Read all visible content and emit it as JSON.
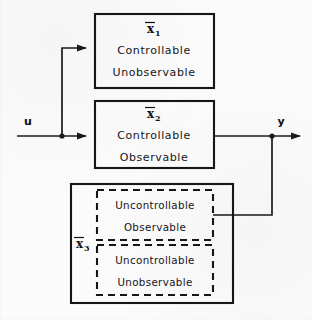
{
  "figure": {
    "type": "block-diagram",
    "background_color": "#fbfbfb",
    "line_color": "#16161a"
  },
  "signals": {
    "input_label": "u",
    "output_label": "y"
  },
  "blocks": [
    {
      "id": "x1",
      "state_label": "x",
      "state_subscript": "1",
      "overbar": true,
      "border": "solid",
      "lines": [
        "Controllable",
        "Unobservable"
      ]
    },
    {
      "id": "x2",
      "state_label": "x",
      "state_subscript": "2",
      "overbar": true,
      "border": "solid",
      "lines": [
        "Controllable",
        "Observable"
      ]
    },
    {
      "id": "x3",
      "state_label": "x",
      "state_subscript": "3",
      "overbar": true,
      "border": "solid",
      "lines": [],
      "sub_blocks": [
        {
          "id": "x3a",
          "border": "dashed",
          "lines": [
            "Uncontrollable",
            "Observable"
          ]
        },
        {
          "id": "x3b",
          "border": "dashed",
          "lines": [
            "Uncontrollable",
            "Unobservable"
          ]
        }
      ]
    }
  ],
  "connections": [
    {
      "from": "u",
      "to": "x1",
      "style": "branch-up"
    },
    {
      "from": "u",
      "to": "x2",
      "style": "straight"
    },
    {
      "from": "x2",
      "to": "y",
      "style": "straight"
    },
    {
      "from": "x3a",
      "to": "y",
      "style": "feedforward-join"
    }
  ]
}
